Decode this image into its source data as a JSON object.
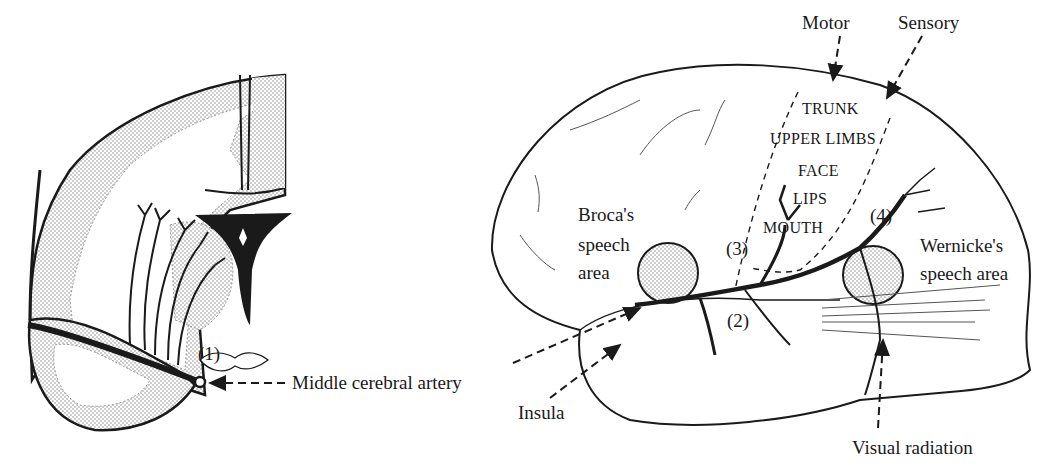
{
  "figure": {
    "colors": {
      "ink": "#1a1a1a",
      "stipple": "#9a9a9a",
      "background": "#ffffff"
    }
  },
  "coronal_section": {
    "labels": {
      "branch_1": "(1)",
      "artery": "Middle cerebral artery"
    }
  },
  "lateral_view": {
    "labels": {
      "motor": "Motor",
      "sensory": "Sensory",
      "homunculus": [
        "TRUNK",
        "UPPER LIMBS",
        "FACE",
        "LIPS",
        "MOUTH"
      ],
      "branch_2": "(2)",
      "branch_3": "(3)",
      "branch_4": "(4)",
      "broca": [
        "Broca's",
        "speech",
        "area"
      ],
      "wernicke": [
        "Wernicke's",
        "speech area"
      ],
      "insula": "Insula",
      "visual_radiation": "Visual radiation"
    }
  }
}
